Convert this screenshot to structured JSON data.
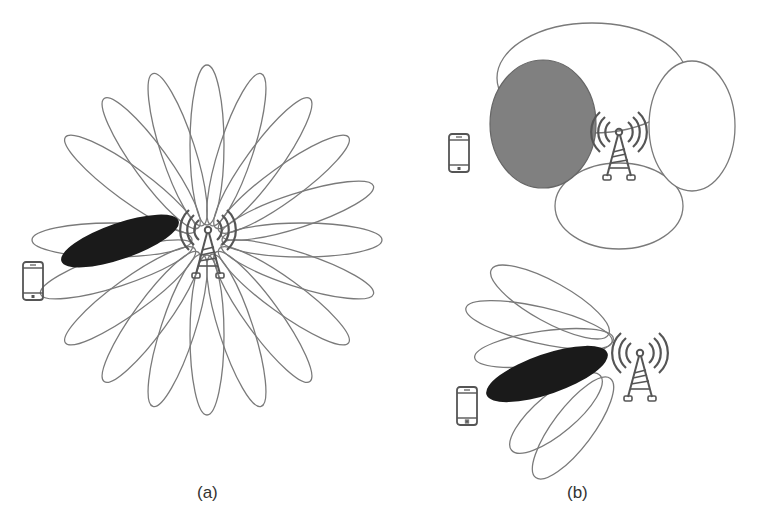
{
  "figure": {
    "panels": [
      {
        "id": "a",
        "label": "(a)",
        "description": "Narrow-beam beamforming: 20 narrow lobes radiating around a cell tower; one lobe (black) directed toward the phone",
        "lobe_count": 20,
        "active_lobe_color": "#1a1a1a"
      },
      {
        "id": "b-top",
        "label": "(b)",
        "description": "Wide-beam sectors: four broad lobes around a tower; the left sector (gray) covers the phone",
        "lobe_count": 4,
        "active_lobe_color": "#808080"
      },
      {
        "id": "b-bottom",
        "label": "",
        "description": "Subset of narrow lobes fanning toward the phone; one lobe (black) selected",
        "lobe_count": 6,
        "active_lobe_color": "#1a1a1a"
      }
    ],
    "captions": {
      "a": "(a)",
      "b": "(b)"
    },
    "icons": [
      "cell-tower-icon",
      "smartphone-icon"
    ],
    "colors": {
      "outline": "#7a7a7a",
      "active_narrow": "#1a1a1a",
      "active_wide": "#808080",
      "background": "#ffffff"
    }
  }
}
